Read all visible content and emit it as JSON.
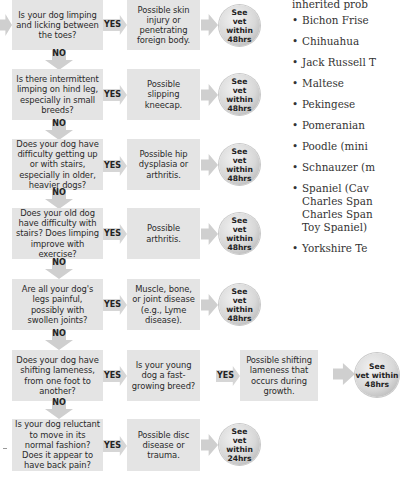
{
  "flowchart": {
    "yes_label": "YES",
    "no_label": "NO",
    "rows": [
      {
        "question": "Is your dog limping and licking between the toes?",
        "answer": "Possible skin injury or penetrating foreign body.",
        "outcome": "See\nvet within\n48hrs"
      },
      {
        "question": "Is there intermittent limping on hind leg, especially in small breeds?",
        "answer": "Possible slipping kneecap.",
        "outcome": "See\nvet within\n48hrs"
      },
      {
        "question": "Does your dog have difficulty getting up or with stairs, especially in older, heavier dogs?",
        "answer": "Possible hip dysplasia or arthritis.",
        "outcome": "See\nvet within\n48hrs"
      },
      {
        "question": "Does your old dog have difficulty with stairs? Does limping improve with exercise?",
        "answer": "Possible arthritis.",
        "outcome": "See\nvet within\n48hrs"
      },
      {
        "question": "Are all your dog's legs painful, possibly with swollen joints?",
        "answer": "Muscle, bone, or joint disease (e.g., Lyme disease).",
        "outcome": "See\nvet within\n48hrs"
      },
      {
        "question": "Does your dog have shifting lameness, from one foot to another?",
        "answer": "Is your young dog a fast-growing breed?",
        "answer2": "Possible shifting lameness that occurs during growth.",
        "outcome": "See\nvet within\n48hrs"
      },
      {
        "question": "Is your dog reluctant to move in its normal fashion? Does it appear to have back pain?",
        "answer": "Possible disc disease or trauma.",
        "outcome": "See\nvet within\n24hrs"
      }
    ]
  },
  "sidebar": {
    "intro": "inherited prob",
    "items": [
      "Bichon Frise",
      "Chihuahua",
      "Jack Russell T",
      "Maltese",
      "Pekingese",
      "Pomeranian",
      "Poodle (mini",
      "Schnauzer (m",
      "Spaniel (Cav\nCharles Span\nCharles Span\nToy Spaniel)",
      "Yorkshire Te"
    ]
  }
}
